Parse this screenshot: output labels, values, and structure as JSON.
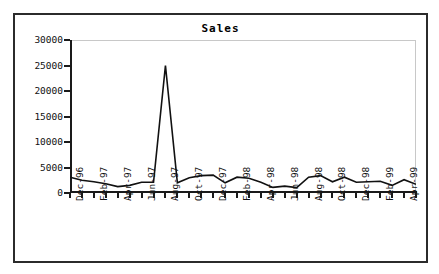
{
  "chart_data": {
    "type": "line",
    "title": "Sales",
    "xlabel": "",
    "ylabel": "",
    "ylim": [
      0,
      30000
    ],
    "yticks": [
      0,
      5000,
      10000,
      15000,
      20000,
      25000,
      30000
    ],
    "ytick_labels": [
      "0",
      "5000",
      "10000",
      "15000",
      "20000",
      "25000",
      "30000"
    ],
    "grid": false,
    "legend": false,
    "legend_position": "none",
    "series_name": "Sales",
    "line_color": "#111111",
    "categories": [
      "Dec-96",
      "Jan-97",
      "Feb-97",
      "Mar-97",
      "Apr-97",
      "May-97",
      "Jun-97",
      "Jul-97",
      "Aug-97",
      "Sep-97",
      "Oct-97",
      "Nov-97",
      "Dec-97",
      "Jan-98",
      "Feb-98",
      "Mar-98",
      "Apr-98",
      "May-98",
      "Jun-98",
      "Jul-98",
      "Aug-98",
      "Sep-98",
      "Oct-98",
      "Nov-98",
      "Dec-98",
      "Jan-99",
      "Feb-99",
      "Mar-99",
      "Apr-99",
      "May-99"
    ],
    "tick_labels_shown": [
      "Dec-96",
      "Feb-97",
      "Apr-97",
      "Jun-97",
      "Aug-97",
      "Oct-97",
      "Dec-97",
      "Feb-98",
      "Apr-98",
      "Jun-98",
      "Aug-98",
      "Oct-98",
      "Dec-98",
      "Feb-99",
      "Apr-99"
    ],
    "values": [
      3100,
      2500,
      2200,
      1800,
      1250,
      1500,
      2100,
      2100,
      25000,
      2000,
      3000,
      3400,
      3500,
      2000,
      3100,
      2900,
      2100,
      1100,
      1350,
      1050,
      3100,
      3400,
      2200,
      3100,
      2100,
      2200,
      2300,
      1500,
      2600,
      1700
    ],
    "peak": {
      "category": "Aug-97",
      "value": 25000
    }
  }
}
